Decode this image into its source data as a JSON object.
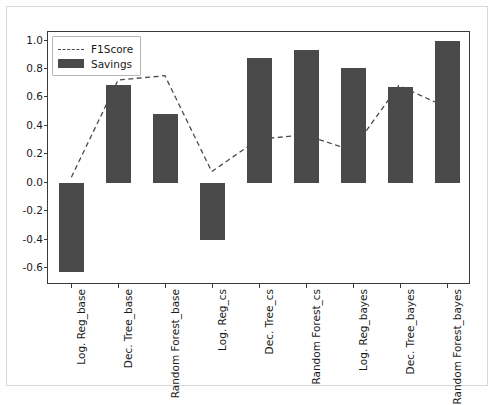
{
  "figure": {
    "background": "#ffffff",
    "bar_color": "#4a4a4a",
    "line_color": "#4a4a4a",
    "axis_color": "#3a3a3a"
  },
  "legend": {
    "position": "upper-left",
    "entries": [
      {
        "label": "F1Score",
        "style": "dashed-line"
      },
      {
        "label": "Savings",
        "style": "filled-patch"
      }
    ]
  },
  "chart_data": {
    "type": "bar",
    "title": "",
    "xlabel": "",
    "ylabel": "",
    "ylim": [
      -0.72,
      1.06
    ],
    "yticks": [
      1.0,
      0.8,
      0.6,
      0.4,
      0.2,
      0.0,
      -0.2,
      -0.4,
      -0.6
    ],
    "ytick_labels": [
      "1.0",
      "0.8",
      "0.6",
      "0.4",
      "0.2",
      "0.0",
      "-0.2",
      "-0.4",
      "-0.6"
    ],
    "grid": false,
    "legend_position": "upper left",
    "categories": [
      "Log. Reg_base",
      "Dec. Tree_base",
      "Random Forest_base",
      "Log. Reg_cs",
      "Dec. Tree_cs",
      "Random Forest_cs",
      "Log. Reg_bayes",
      "Dec. Tree_bayes",
      "Random Forest_bayes"
    ],
    "series": [
      {
        "name": "Savings",
        "type": "bar",
        "values": [
          -0.63,
          0.69,
          0.48,
          -0.4,
          0.88,
          0.93,
          0.81,
          0.67,
          1.0
        ]
      },
      {
        "name": "F1Score",
        "type": "line",
        "linestyle": "dashed",
        "values": [
          0.03,
          0.72,
          0.75,
          0.07,
          0.3,
          0.33,
          0.22,
          0.68,
          0.53
        ]
      }
    ]
  }
}
